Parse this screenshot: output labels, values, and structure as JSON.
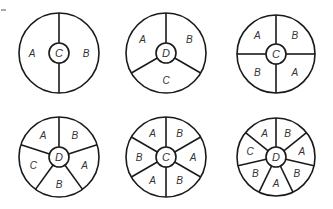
{
  "stroke_color": "#1a1a1a",
  "label_color": "#333333",
  "spinners": [
    {
      "id": "spinner-1",
      "cx": 59,
      "cy": 53,
      "r": 40,
      "hub_r": 10,
      "start_angle": 0,
      "hub_label": "C",
      "sectors": [
        "B",
        "A"
      ]
    },
    {
      "id": "spinner-2",
      "cx": 166,
      "cy": 53,
      "r": 40,
      "hub_r": 10,
      "start_angle": 0,
      "hub_label": "D",
      "sectors": [
        "B",
        "C",
        "A"
      ]
    },
    {
      "id": "spinner-3",
      "cx": 276,
      "cy": 54,
      "r": 39,
      "hub_r": 10,
      "start_angle": 0,
      "hub_label": "C",
      "sectors": [
        "B",
        "A",
        "B",
        "A"
      ]
    },
    {
      "id": "spinner-4",
      "cx": 59,
      "cy": 157,
      "r": 40,
      "hub_r": 10,
      "start_angle": 0,
      "hub_label": "D",
      "sectors": [
        "B",
        "A",
        "B",
        "C",
        "A"
      ]
    },
    {
      "id": "spinner-5",
      "cx": 166,
      "cy": 157,
      "r": 40,
      "hub_r": 10,
      "start_angle": 0,
      "hub_label": "C",
      "sectors": [
        "B",
        "A",
        "B",
        "A",
        "B",
        "A"
      ]
    },
    {
      "id": "spinner-6",
      "cx": 276,
      "cy": 157,
      "r": 39,
      "hub_r": 10,
      "start_angle": 0,
      "hub_label": "D",
      "sectors": [
        "B",
        "A",
        "B",
        "A",
        "B",
        "C",
        "A"
      ]
    }
  ]
}
